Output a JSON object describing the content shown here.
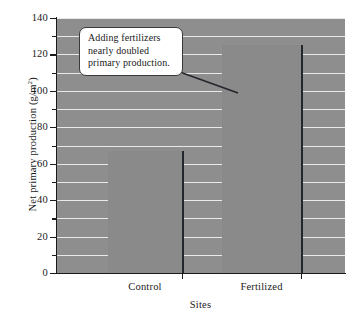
{
  "chart_data": {
    "type": "bar",
    "title": "",
    "categories": [
      "Control",
      "Fertilized"
    ],
    "values": [
      67,
      125
    ],
    "series": [
      {
        "name": "Net primary production",
        "values": [
          67,
          125
        ]
      }
    ],
    "xlabel": "Sites",
    "ylabel": "Net primary production (g/m2)",
    "ylabel_base": "Net primary production (g/m",
    "ylabel_sup": "2",
    "ylabel_close": ")",
    "ylim": [
      0,
      140
    ],
    "ytick_major": [
      0,
      20,
      40,
      60,
      80,
      100,
      120,
      140
    ],
    "ytick_minor": [
      10,
      30,
      50,
      70,
      90,
      110,
      130
    ],
    "ytick_labels": [
      "0",
      "20",
      "40",
      "60",
      "80",
      "100",
      "120",
      "140"
    ],
    "gridlines": [
      10,
      20,
      30,
      40,
      50,
      60,
      70,
      80,
      90,
      100,
      110,
      120,
      130,
      140
    ],
    "grid": true,
    "legend": "none",
    "annotations": [
      {
        "text_lines": [
          "Adding fertilizers",
          "nearly doubled",
          "primary production."
        ],
        "text": "Adding fertilizers nearly doubled primary production.",
        "points_to": "Fertilized"
      }
    ],
    "colors": {
      "plot_background": "#8e8e8e",
      "bar_fill": "#8a8a8a",
      "bar_edge": "#23262b",
      "gridline": "#e9e9e9",
      "axis": "#1a1a1a",
      "callout_background": "#ffffff",
      "callout_border": "#3a3a3a",
      "page_background": "#ffffff"
    }
  }
}
